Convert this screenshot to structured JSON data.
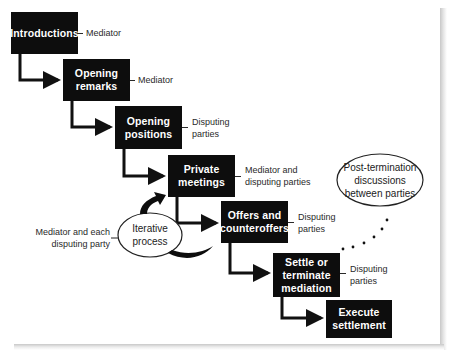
{
  "diagram": {
    "steps": [
      {
        "label": "Introductions",
        "role": "Mediator"
      },
      {
        "label": "Opening\nremarks",
        "role": "Mediator"
      },
      {
        "label": "Opening\npositions",
        "role": "Disputing\nparties"
      },
      {
        "label": "Private\nmeetings",
        "role": "Mediator and\ndisputing parties"
      },
      {
        "label": "Offers and\ncounteroffers",
        "role": "Disputing\nparties"
      },
      {
        "label": "Settle or\nterminate\nmediation",
        "role": "Disputing\nparties"
      },
      {
        "label": "Execute\nsettlement",
        "role": ""
      }
    ],
    "iterative": {
      "label": "Iterative\nprocess",
      "role": "Mediator and each\ndisputing party"
    },
    "post_termination": {
      "label": "Post-termination\ndiscussions\nbetween parties"
    },
    "colors": {
      "box_fill": "#0d0d0d",
      "box_text": "#ffffff",
      "line": "#111111",
      "role_text": "#2a2a2a"
    }
  }
}
